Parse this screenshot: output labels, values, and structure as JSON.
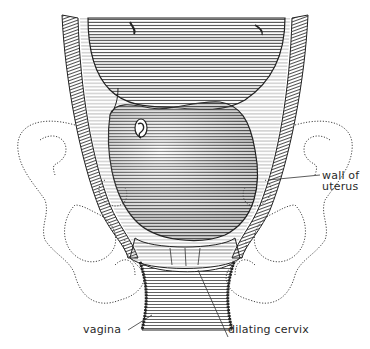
{
  "figure": {
    "colors": {
      "ink": "#2a2a2a",
      "paper": "#ffffff",
      "shade": "#555555"
    },
    "labels": {
      "wall_of_uterus": [
        "wall of",
        "uterus"
      ],
      "vagina": "vagina",
      "dilating_cervix": "dilating cervix"
    }
  }
}
